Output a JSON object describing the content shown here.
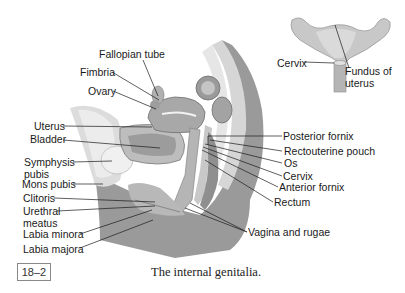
{
  "figure": {
    "number": "18–2",
    "caption": "The internal genitalia."
  },
  "inset": {
    "title": "Uterus (frontal view)",
    "labels": {
      "cervix": "Cervix",
      "fundus": "Fundus of uterus"
    }
  },
  "labels": {
    "fallopian_tube": "Fallopian tube",
    "fimbria": "Fimbria",
    "ovary": "Ovary",
    "uterus": "Uterus",
    "bladder": "Bladder",
    "symphysis_pubis_1": "Symphysis",
    "symphysis_pubis_2": "pubis",
    "mons_pubis": "Mons pubis",
    "clitoris": "Clitoris",
    "urethral_meatus_1": "Urethral",
    "urethral_meatus_2": "meatus",
    "labia_minora": "Labia minora",
    "labia_majora": "Labia majora",
    "posterior_fornix": "Posterior fornix",
    "rectouterine_pouch": "Rectouterine pouch",
    "os": "Os",
    "cervix": "Cervix",
    "anterior_fornix": "Anterior fornix",
    "rectum": "Rectum",
    "vagina_rugae": "Vagina and rugae"
  },
  "colors": {
    "tissue_dark": "#8f8f8f",
    "tissue_mid": "#b3b3b3",
    "tissue_light": "#d9d9d9",
    "tissue_pale": "#ececec",
    "leader_line": "#1a1a1a"
  }
}
